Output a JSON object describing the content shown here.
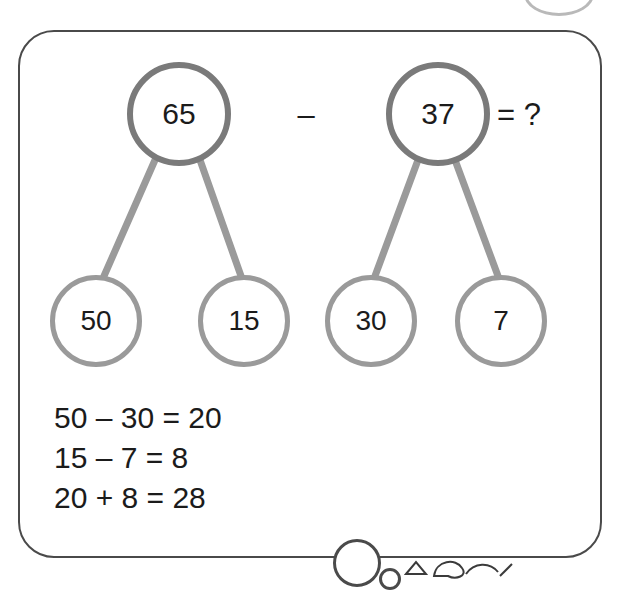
{
  "diagram": {
    "expression": {
      "minuend": "65",
      "operator": "–",
      "subtrahend": "37",
      "result": "= ?"
    },
    "bonds": [
      {
        "id": "bond-65",
        "parent": "65",
        "children": [
          "50",
          "15"
        ]
      },
      {
        "id": "bond-37",
        "parent": "37",
        "children": [
          "30",
          "7"
        ]
      }
    ],
    "working": [
      "50 – 30 = 20",
      "15 – 7 = 8",
      "20 + 8 = 28"
    ],
    "colors": {
      "card_border": "#4a4a4a",
      "top_bubble_border": "#7a7a7a",
      "leaf_bubble_border": "#9a9a9a",
      "connector": "#9a9a9a",
      "text": "#1b1b1b"
    }
  }
}
